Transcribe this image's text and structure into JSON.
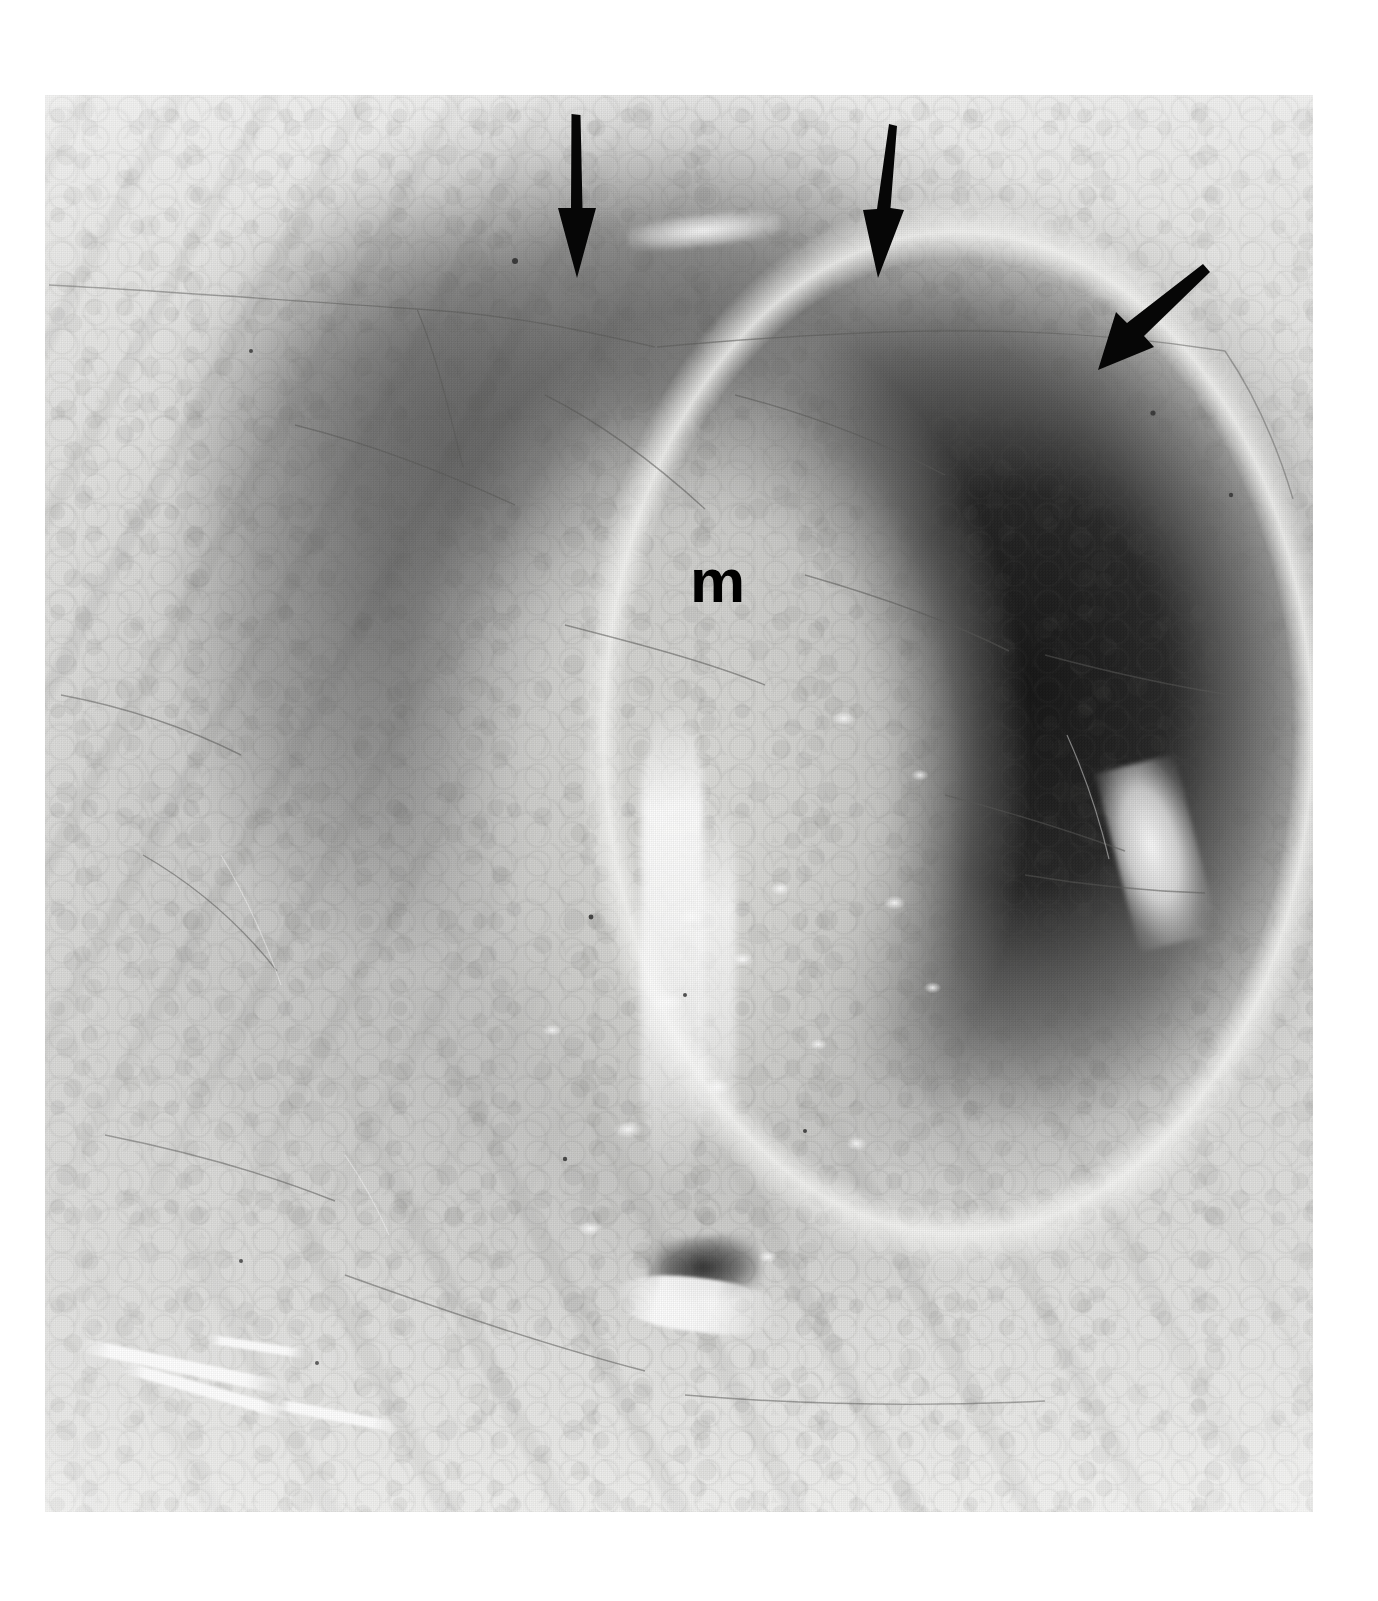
{
  "figure": {
    "kind": "grayscale-photomicrograph",
    "plate": {
      "left": 45,
      "top": 95,
      "width": 1268,
      "height": 1417,
      "background_color": "#ffffff",
      "border": "none"
    }
  },
  "annotations": {
    "labels": [
      {
        "id": "label-m",
        "text": "m",
        "meaning": "mass",
        "x": 690,
        "y": 550,
        "font_size_px": 62,
        "weight": "bold",
        "color": "#000000"
      }
    ],
    "arrows": [
      {
        "id": "arrow-1",
        "name": "arrow-left",
        "direction": "down",
        "angle_deg": 90,
        "tail_x": 574,
        "tail_y": 122,
        "tip_x": 576,
        "tip_y": 266,
        "color": "#060606",
        "shaft_width_px": 9,
        "head_width_px": 34,
        "head_length_px": 72
      },
      {
        "id": "arrow-2",
        "name": "arrow-middle",
        "direction": "down",
        "angle_deg": 90,
        "tail_x": 886,
        "tail_y": 131,
        "tip_x": 880,
        "tip_y": 265,
        "color": "#060606",
        "shaft_width_px": 9,
        "head_width_px": 34,
        "head_length_px": 70
      },
      {
        "id": "arrow-3",
        "name": "arrow-right",
        "direction": "down-left",
        "angle_deg": 135,
        "tail_x": 1186,
        "tail_y": 276,
        "tip_x": 1112,
        "tip_y": 376,
        "color": "#060606",
        "shaft_width_px": 9,
        "head_width_px": 36,
        "head_length_px": 70
      }
    ]
  },
  "palette": {
    "paper_white": "#ffffff",
    "film_light": "#efefee",
    "film_mid": "#d5d5d3",
    "film_dark": "#3a3a3a",
    "film_black": "#0a0a0a",
    "annotation_black": "#060606",
    "highlight_white": "#ffffff"
  },
  "regions": [
    {
      "name": "surface-epithelial-band",
      "tone": "light",
      "note": "pale band across the top marked by the three arrows"
    },
    {
      "name": "dark-crescent-right",
      "tone": "near-black",
      "note": "heavily stained crescent along the right flank of the lesion"
    },
    {
      "name": "central-mass",
      "tone": "mid-light-mottled",
      "note": "glandular mottled mass labelled m"
    },
    {
      "name": "specular-streak",
      "tone": "white",
      "note": "vertical glistening streak through the lower mass"
    },
    {
      "name": "stromal-striations",
      "tone": "light-grey",
      "note": "diagonal fibrous striations filling the left and lower margins"
    }
  ]
}
